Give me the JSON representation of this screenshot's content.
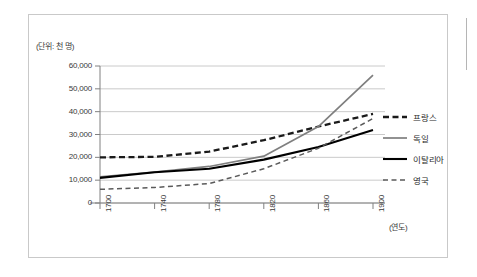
{
  "chart_data": {
    "type": "line",
    "title": "",
    "subtitle": "",
    "unit_label": "(단위: 천 명)",
    "xlabel": "(연도)",
    "ylabel": "",
    "x": [
      1700,
      1740,
      1780,
      1820,
      1860,
      1900
    ],
    "xtick_labels": [
      "1700",
      "1740",
      "1780",
      "1820",
      "1860",
      "1900"
    ],
    "ytick_labels": [
      "0",
      "10,000",
      "20,000",
      "30,000",
      "40,000",
      "50,000",
      "60,000"
    ],
    "yticks": [
      0,
      10000,
      20000,
      30000,
      40000,
      50000,
      60000
    ],
    "ylim": [
      0,
      60000
    ],
    "xlim": [
      1700,
      1900
    ],
    "grid": "horizontal",
    "legend_position": "right",
    "series": [
      {
        "name": "프랑스",
        "style": "thick-dashed",
        "color": "#1a1a1a",
        "values": [
          20000,
          20200,
          22500,
          27500,
          33500,
          39000
        ]
      },
      {
        "name": "독일",
        "style": "solid-gray",
        "color": "#7f7f7f",
        "values": [
          11500,
          13500,
          16000,
          20500,
          33500,
          56000
        ]
      },
      {
        "name": "이탈리아",
        "style": "solid-black",
        "color": "#000000",
        "values": [
          11000,
          13500,
          15000,
          19000,
          24500,
          32000
        ]
      },
      {
        "name": "영국",
        "style": "thin-dashed",
        "color": "#5a5a5a",
        "values": [
          6000,
          6800,
          8500,
          15000,
          24000,
          37000
        ]
      }
    ]
  },
  "legend": {
    "items": [
      {
        "label": "프랑스",
        "style": "thick-dashed",
        "color": "#1a1a1a"
      },
      {
        "label": "독일",
        "style": "solid-gray",
        "color": "#7f7f7f"
      },
      {
        "label": "이탈리아",
        "style": "solid-black",
        "color": "#000000"
      },
      {
        "label": "영국",
        "style": "thin-dashed",
        "color": "#5a5a5a"
      }
    ]
  },
  "colors": {
    "axis": "#808080",
    "grid": "#bdbdbd",
    "frame": "#c9c9c9",
    "text": "#3a3a3a",
    "background": "#ffffff"
  }
}
